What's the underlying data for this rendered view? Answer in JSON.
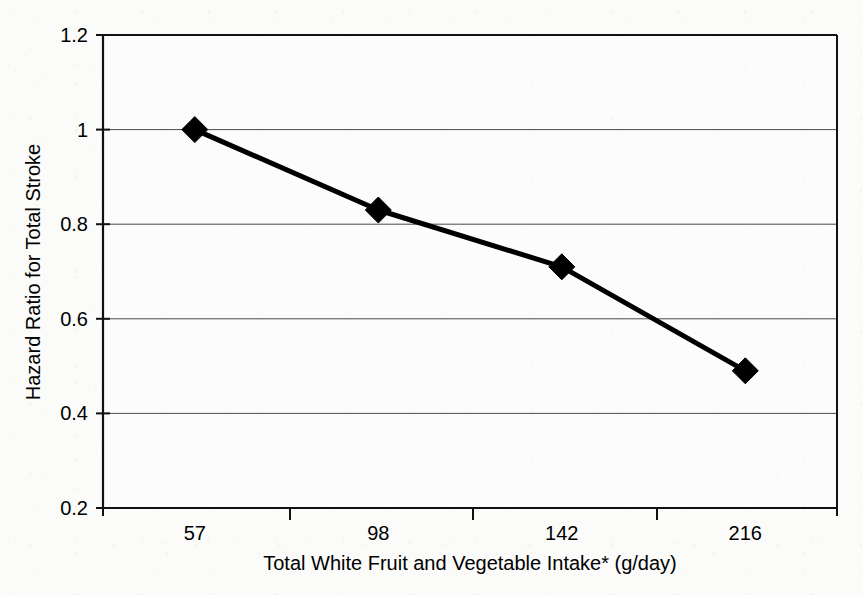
{
  "chart_data": {
    "type": "line",
    "title": "",
    "subtitle": "",
    "xlabel": "Total White Fruit and Vegetable Intake* (g/day)",
    "ylabel": "Hazard Ratio for Total Stroke",
    "categories": [
      "57",
      "98",
      "142",
      "216"
    ],
    "x": [
      57,
      98,
      142,
      216
    ],
    "values": [
      1.0,
      0.83,
      0.71,
      0.49
    ],
    "series": [
      {
        "name": "Total White Fruit and Vegetable Intake",
        "values": [
          1.0,
          0.83,
          0.71,
          0.49
        ]
      }
    ],
    "ylim": [
      0.2,
      1.2
    ],
    "y_ticks": [
      "0.2",
      "0.4",
      "0.6",
      "0.8",
      "1",
      "1.2"
    ],
    "y_tick_values": [
      0.2,
      0.4,
      0.6,
      0.8,
      1.0,
      1.2
    ],
    "x_ticks": [
      "57",
      "98",
      "142",
      "216"
    ],
    "grid": "horizontal",
    "legend": "none",
    "marker": "diamond",
    "line_color": "#000000",
    "marker_color": "#000000",
    "grid_color": "#4a4a4a",
    "axis_color": "#111111",
    "background_color": "#fbfbfa",
    "annotations": [
      "*"
    ]
  }
}
